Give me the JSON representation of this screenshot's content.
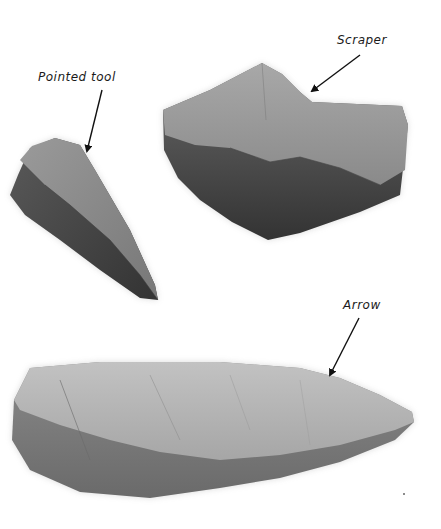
{
  "figure": {
    "background": "#ffffff",
    "tools": [
      {
        "id": "scraper",
        "label": "Scraper",
        "tone_light": "#9a9a9a",
        "tone_dark": "#3c3c3c"
      },
      {
        "id": "pointed-tool",
        "label": "Pointed tool",
        "tone_light": "#8c8c8c",
        "tone_dark": "#3a3a3a"
      },
      {
        "id": "arrow",
        "label": "Arrow",
        "tone_light": "#b4b4b4",
        "tone_dark": "#5a5a5a"
      }
    ]
  }
}
